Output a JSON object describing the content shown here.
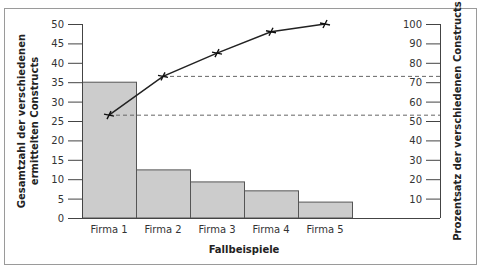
{
  "chart_data": {
    "type": "bar",
    "combo": "pareto (bar + cumulative line)",
    "categories": [
      "Firma 1",
      "Firma 2",
      "Firma 3",
      "Firma 4",
      "Firma 5"
    ],
    "series": [
      {
        "name": "Gesamtzahl der verschiedenen ermittelten Constructs",
        "type": "bar",
        "axis": "left",
        "values": [
          35,
          12.4,
          9.3,
          7.0,
          4.1
        ],
        "color": "#cccccc"
      },
      {
        "name": "Prozentsatz der verschiedenen Constructs",
        "type": "line",
        "axis": "right",
        "marker": "x",
        "values": [
          53,
          73,
          85,
          96,
          100
        ],
        "color": "#222222"
      }
    ],
    "xlabel": "Fallbeispiele",
    "ylabel_left": "Gesamtzahl der verschiedenen ermittelten Constructs",
    "ylabel_left_lines": [
      "Gesamtzahl der verschiedenen",
      "ermittelten Constructs"
    ],
    "ylabel_right": "Prozentsatz der verschiedenen Constructs",
    "ylim_left": [
      0,
      50
    ],
    "yticks_left": [
      0,
      5,
      10,
      15,
      20,
      25,
      30,
      35,
      40,
      45,
      50
    ],
    "ylim_right": [
      0,
      100
    ],
    "yticks_right": [
      10,
      20,
      30,
      40,
      50,
      60,
      70,
      80,
      90,
      100
    ],
    "reference_lines": [
      {
        "style": "dashed",
        "from_point": 1,
        "value_right_axis": 53
      },
      {
        "style": "dashed",
        "from_point": 2,
        "value_right_axis": 73
      }
    ],
    "grid": false,
    "legend": "none"
  }
}
